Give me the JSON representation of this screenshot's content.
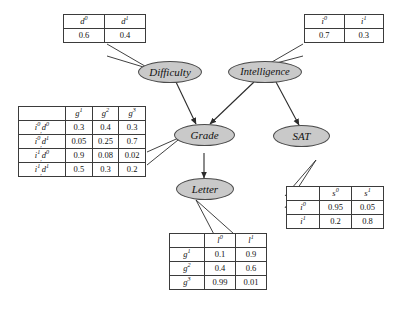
{
  "diagram": {
    "node_fill": "#c9c9c9",
    "node_stroke": "#4a4a4a",
    "background": "#ffffff"
  },
  "nodes": {
    "difficulty": "Difficulty",
    "intelligence": "Intelligence",
    "grade": "Grade",
    "sat": "SAT",
    "letter": "Letter"
  },
  "tables": {
    "difficulty": {
      "name": "difficulty-cpt",
      "headers": [
        "d0",
        "d1"
      ],
      "headers_display": [
        "d",
        "d"
      ],
      "header_sups": [
        "0",
        "1"
      ],
      "values": [
        "0.6",
        "0.4"
      ]
    },
    "intelligence": {
      "name": "intelligence-cpt",
      "headers_display": [
        "i",
        "i"
      ],
      "header_sups": [
        "0",
        "1"
      ],
      "values": [
        "0.7",
        "0.3"
      ]
    },
    "grade": {
      "name": "grade-cpt",
      "corner": "",
      "headers_display": [
        "g",
        "g",
        "g"
      ],
      "header_sups": [
        "1",
        "2",
        "3"
      ],
      "rows": [
        {
          "label_parts": [
            [
              "i",
              "0"
            ],
            [
              "d",
              "0"
            ]
          ],
          "values": [
            "0.3",
            "0.4",
            "0.3"
          ]
        },
        {
          "label_parts": [
            [
              "i",
              "0"
            ],
            [
              "d",
              "1"
            ]
          ],
          "values": [
            "0.05",
            "0.25",
            "0.7"
          ]
        },
        {
          "label_parts": [
            [
              "i",
              "1"
            ],
            [
              "d",
              "0"
            ]
          ],
          "values": [
            "0.9",
            "0.08",
            "0.02"
          ]
        },
        {
          "label_parts": [
            [
              "i",
              "1"
            ],
            [
              "d",
              "1"
            ]
          ],
          "values": [
            "0.5",
            "0.3",
            "0.2"
          ]
        }
      ]
    },
    "letter": {
      "name": "letter-cpt",
      "corner": "",
      "headers_display": [
        "l",
        "l"
      ],
      "header_sups": [
        "0",
        "1"
      ],
      "rows": [
        {
          "label": "g",
          "label_sup": "1",
          "values": [
            "0.1",
            "0.9"
          ]
        },
        {
          "label": "g",
          "label_sup": "2",
          "values": [
            "0.4",
            "0.6"
          ]
        },
        {
          "label": "g",
          "label_sup": "3",
          "values": [
            "0.99",
            "0.01"
          ]
        }
      ]
    },
    "sat": {
      "name": "sat-cpt",
      "corner": "",
      "headers_display": [
        "s",
        "s"
      ],
      "header_sups": [
        "0",
        "1"
      ],
      "rows": [
        {
          "label": "i",
          "label_sup": "0",
          "values": [
            "0.95",
            "0.05"
          ]
        },
        {
          "label": "i",
          "label_sup": "1",
          "values": [
            "0.2",
            "0.8"
          ]
        }
      ]
    }
  },
  "edges": [
    {
      "from": "difficulty",
      "to": "grade"
    },
    {
      "from": "intelligence",
      "to": "grade"
    },
    {
      "from": "intelligence",
      "to": "sat"
    },
    {
      "from": "grade",
      "to": "letter"
    }
  ]
}
